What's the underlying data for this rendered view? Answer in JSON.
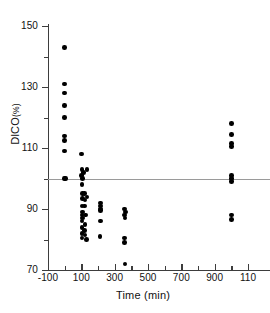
{
  "chart_data": {
    "type": "scatter",
    "title": "",
    "xlabel": "Time (min)",
    "ylabel": "DlCO (%)",
    "ylabel_text": "DlCO",
    "ylabel_unit": "(%)",
    "xlim": [
      -100,
      1100
    ],
    "ylim": [
      70,
      150
    ],
    "grid": false,
    "legend": null,
    "x_major_ticks": [
      -100,
      100,
      300,
      500,
      700,
      900,
      1100
    ],
    "x_major_tick_labels": [
      "-100",
      "100",
      "300",
      "500",
      "700",
      "900",
      "110"
    ],
    "x_minor_ticks": [
      0,
      200,
      400,
      600,
      800,
      1000
    ],
    "y_major_ticks": [
      70,
      90,
      110,
      130,
      150
    ],
    "y_major_tick_labels": [
      "70",
      "90",
      "110",
      "130",
      "150"
    ],
    "y_minor_ticks": [
      80,
      100,
      120,
      140
    ],
    "reference_line": {
      "orientation": "horizontal",
      "y": 100,
      "color": "#9a9a9a"
    },
    "marker": {
      "shape": "circle",
      "color": "#000000",
      "size": 4.6
    },
    "points": [
      {
        "x": 0,
        "y": 143
      },
      {
        "x": 0,
        "y": 131
      },
      {
        "x": 0,
        "y": 128
      },
      {
        "x": 0,
        "y": 124
      },
      {
        "x": 0,
        "y": 120
      },
      {
        "x": 0,
        "y": 114
      },
      {
        "x": 0,
        "y": 112.5
      },
      {
        "x": 0,
        "y": 109
      },
      {
        "x": 0,
        "y": 100
      },
      {
        "x": 4,
        "y": 100
      },
      {
        "x": 100,
        "y": 108
      },
      {
        "x": 105,
        "y": 103
      },
      {
        "x": 135,
        "y": 103
      },
      {
        "x": 102,
        "y": 101
      },
      {
        "x": 112,
        "y": 102
      },
      {
        "x": 108,
        "y": 100
      },
      {
        "x": 104,
        "y": 98
      },
      {
        "x": 106,
        "y": 95
      },
      {
        "x": 120,
        "y": 95
      },
      {
        "x": 134,
        "y": 94
      },
      {
        "x": 106,
        "y": 93.5
      },
      {
        "x": 122,
        "y": 93
      },
      {
        "x": 104,
        "y": 91
      },
      {
        "x": 118,
        "y": 91
      },
      {
        "x": 106,
        "y": 89
      },
      {
        "x": 104,
        "y": 88
      },
      {
        "x": 126,
        "y": 88
      },
      {
        "x": 108,
        "y": 87
      },
      {
        "x": 104,
        "y": 86
      },
      {
        "x": 122,
        "y": 85
      },
      {
        "x": 105,
        "y": 84
      },
      {
        "x": 104,
        "y": 82
      },
      {
        "x": 118,
        "y": 83
      },
      {
        "x": 122,
        "y": 81.5
      },
      {
        "x": 105,
        "y": 80.5
      },
      {
        "x": 130,
        "y": 80
      },
      {
        "x": 216,
        "y": 92
      },
      {
        "x": 216,
        "y": 91
      },
      {
        "x": 216,
        "y": 90
      },
      {
        "x": 216,
        "y": 89.5
      },
      {
        "x": 214,
        "y": 86
      },
      {
        "x": 212,
        "y": 81
      },
      {
        "x": 360,
        "y": 90
      },
      {
        "x": 364,
        "y": 89
      },
      {
        "x": 360,
        "y": 88
      },
      {
        "x": 362,
        "y": 87
      },
      {
        "x": 360,
        "y": 80.5
      },
      {
        "x": 360,
        "y": 79
      },
      {
        "x": 362,
        "y": 72
      },
      {
        "x": 1000,
        "y": 118
      },
      {
        "x": 1000,
        "y": 114.5
      },
      {
        "x": 1000,
        "y": 111.5
      },
      {
        "x": 1000,
        "y": 110.5
      },
      {
        "x": 1000,
        "y": 101
      },
      {
        "x": 1000,
        "y": 100
      },
      {
        "x": 1000,
        "y": 99
      },
      {
        "x": 1000,
        "y": 88
      },
      {
        "x": 1000,
        "y": 86.5
      }
    ]
  }
}
